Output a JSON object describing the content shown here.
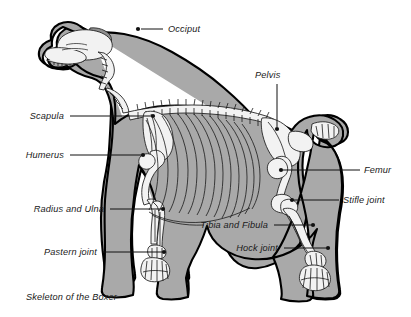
{
  "figure": {
    "caption": "Skeleton of the Boxer",
    "background_color": "#ffffff",
    "body_fill_color": "#a9a9a9",
    "bone_fill_color": "#f2f2f2",
    "outline_color": "#000000",
    "label_color": "#1a1a1a"
  },
  "labels": [
    {
      "id": "occiput",
      "text": "Occiput",
      "anchor": "start",
      "text_x": 168,
      "text_y": 32,
      "line": "M 141,29 L 163,29",
      "dot_x": 138,
      "dot_y": 29
    },
    {
      "id": "pelvis",
      "text": "Pelvis",
      "anchor": "start",
      "text_x": 255,
      "text_y": 78,
      "line": "M 277,84 L 277,127",
      "dot_x": 277,
      "dot_y": 129
    },
    {
      "id": "scapula",
      "text": "Scapula",
      "anchor": "end",
      "text_x": 64,
      "text_y": 119,
      "line": "M 70,116 L 151,116",
      "dot_x": 153,
      "dot_y": 116
    },
    {
      "id": "humerus",
      "text": "Humerus",
      "anchor": "end",
      "text_x": 64,
      "text_y": 158,
      "line": "M 70,155 L 141,155",
      "dot_x": 143,
      "dot_y": 155
    },
    {
      "id": "femur",
      "text": "Femur",
      "anchor": "start",
      "text_x": 364,
      "text_y": 173,
      "line": "M 360,170 L 283,170",
      "dot_x": 281,
      "dot_y": 170
    },
    {
      "id": "radius-and-ulna",
      "text": "Radius and Ulna",
      "anchor": "end",
      "text_x": 104,
      "text_y": 212,
      "line": "M 110,209 L 161,209",
      "dot_x": 163,
      "dot_y": 209
    },
    {
      "id": "stifle-joint",
      "text": "Stifle joint",
      "anchor": "start",
      "text_x": 343,
      "text_y": 203,
      "line": "M 339,200 L 294,200",
      "dot_x": 292,
      "dot_y": 200
    },
    {
      "id": "tibia-and-fibula",
      "text": "Tibia and Fibula",
      "anchor": "end",
      "text_x": 268,
      "text_y": 228,
      "line": "M 274,225 L 311,225",
      "dot_x": 313,
      "dot_y": 225
    },
    {
      "id": "hock-joint",
      "text": "Hock joint",
      "anchor": "end",
      "text_x": 278,
      "text_y": 251,
      "line": "M 284,248 L 326,248",
      "dot_x": 328,
      "dot_y": 248
    },
    {
      "id": "pastern-joint",
      "text": "Pastern joint",
      "anchor": "end",
      "text_x": 97,
      "text_y": 255,
      "line": "M 103,252 L 162,252",
      "dot_x": 164,
      "dot_y": 252
    }
  ],
  "caption_position": {
    "x": 26,
    "y": 300
  },
  "anatomy_parts": [
    "skull",
    "mandible",
    "teeth",
    "occiput",
    "cervical-vertebrae",
    "thoracic-vertebrae",
    "lumbar-vertebrae",
    "caudal-vertebrae-tail",
    "scapula",
    "humerus",
    "radius-and-ulna",
    "carpus-pastern",
    "front-phalanges",
    "sternum",
    "ribcage",
    "pelvis",
    "femur",
    "patella-stifle",
    "tibia-and-fibula",
    "tarsus-hock",
    "rear-phalanges"
  ]
}
